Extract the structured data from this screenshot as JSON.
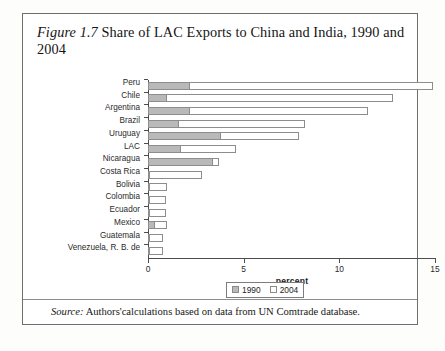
{
  "figure": {
    "number_label": "Figure 1.7",
    "title_rest": " Share of LAC Exports to China and India, 1990 and 2004",
    "full_title": "Figure 1.7 Share of LAC Exports to China and India, 1990 and 2004",
    "source_label": "Source:",
    "source_text": " Authors'calculations based on data from UN Comtrade database."
  },
  "legend": {
    "series_1_label": "1990",
    "series_2_label": "2004",
    "series_1_color": "#b9b9b9",
    "series_2_color": "#ffffff",
    "border_color": "#8a8a8a",
    "position": "bottom-center"
  },
  "axis": {
    "x_title": "percent",
    "x_ticks": [
      "0",
      "5",
      "10",
      "15"
    ]
  },
  "chart_data": {
    "type": "bar",
    "orientation": "horizontal",
    "stacked": false,
    "grouped_overlay": true,
    "title": "Figure 1.7 Share of LAC Exports to China and India, 1990 and 2004",
    "xlabel": "percent",
    "ylabel": "",
    "xlim": [
      0,
      15
    ],
    "xticks": [
      0,
      5,
      10,
      15
    ],
    "grid": false,
    "legend": [
      "1990",
      "2004"
    ],
    "legend_position": "bottom-center",
    "categories": [
      "Peru",
      "Chile",
      "Argentina",
      "Brazil",
      "Uruguay",
      "LAC",
      "Nicaragua",
      "Costa Rica",
      "Bolivia",
      "Colombia",
      "Ecuador",
      "Mexico",
      "Guatemala",
      "Venezuela, R. B. de"
    ],
    "series": [
      {
        "name": "1990",
        "color": "#b9b9b9",
        "values": [
          2.2,
          1.0,
          2.2,
          1.6,
          3.8,
          1.7,
          3.4,
          0.05,
          0.05,
          0.05,
          0.05,
          0.35,
          0.02,
          0.02
        ]
      },
      {
        "name": "2004",
        "color": "#ffffff",
        "values": [
          14.9,
          12.8,
          11.5,
          8.2,
          7.9,
          4.6,
          3.7,
          2.8,
          1.0,
          0.95,
          0.95,
          1.0,
          0.8,
          0.8
        ]
      }
    ],
    "source": "Authors'calculations based on data from UN Comtrade database."
  }
}
